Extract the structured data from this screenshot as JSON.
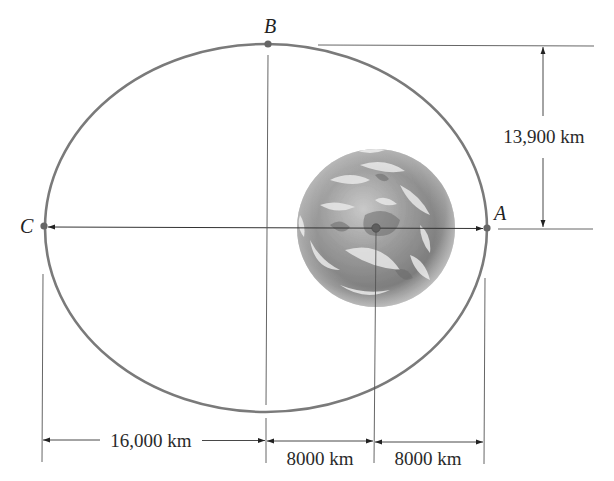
{
  "diagram": {
    "colors": {
      "orbit": "#7a7a7a",
      "point": "#666666",
      "line": "#555555",
      "text": "#222222",
      "background": "#ffffff"
    },
    "points": {
      "A": {
        "label": "A"
      },
      "B": {
        "label": "B"
      },
      "C": {
        "label": "C"
      }
    },
    "dimensions": {
      "semi_minor": "13,900 km",
      "left_segment": "16,000 km",
      "middle_segment": "8000 km",
      "right_segment": "8000 km"
    },
    "earth": {
      "name": "Earth"
    }
  }
}
